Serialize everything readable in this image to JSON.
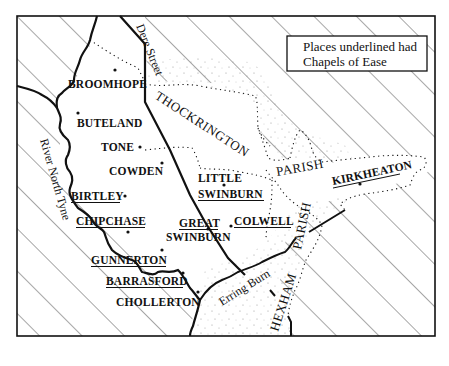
{
  "legend": {
    "line1": "Places underlined had",
    "line2": "Chapels of Ease"
  },
  "roads": {
    "dere_street": "Dere Street"
  },
  "rivers": {
    "north_tyne": "River North Tyne",
    "erring_burn": "Erring Burn"
  },
  "parishes": {
    "thockrington": "THOCKRINGTON",
    "thockrington_parish": "PARISH",
    "hexham": "HEXHAM",
    "hexham_parish": "PARISH"
  },
  "places": [
    {
      "name": "BROOMHOPE",
      "underlined": false
    },
    {
      "name": "BUTELAND",
      "underlined": false
    },
    {
      "name": "TONE",
      "underlined": false
    },
    {
      "name": "COWDEN",
      "underlined": false
    },
    {
      "name": "BIRTLEY",
      "underlined": true
    },
    {
      "name": "CHIPCHASE",
      "underlined": true
    },
    {
      "name": "LITTLE",
      "underlined": true
    },
    {
      "name": "SWINBURN",
      "underlined": true
    },
    {
      "name": "GREAT",
      "underlined": true
    },
    {
      "name": "SWINBURN",
      "underlined": true
    },
    {
      "name": "COLWELL",
      "underlined": true
    },
    {
      "name": "GUNNERTON",
      "underlined": true
    },
    {
      "name": "BARRASFORD",
      "underlined": true
    },
    {
      "name": "CHOLLERTON",
      "underlined": false
    },
    {
      "name": "KIRKHEATON",
      "underlined": true
    }
  ],
  "colors": {
    "ink": "#111111",
    "background": "#ffffff",
    "stipple": "#9a9a9a"
  }
}
